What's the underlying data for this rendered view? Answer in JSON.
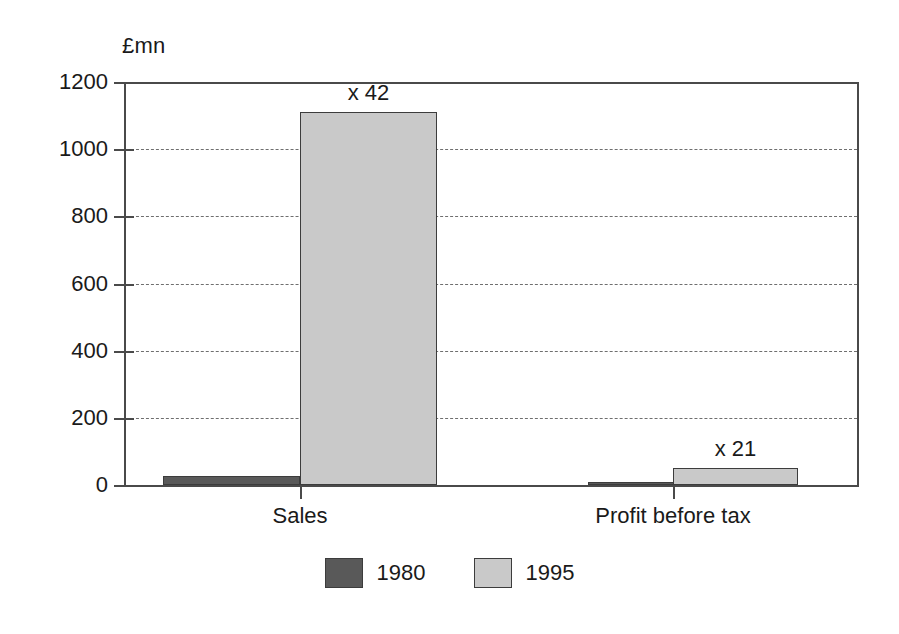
{
  "chart_data": {
    "type": "bar",
    "title": "",
    "subtitle": "",
    "unit_label": "£mn",
    "xlabel": "",
    "ylabel": "£mn",
    "categories": [
      "Sales",
      "Profit before tax"
    ],
    "series": [
      {
        "name": "1980",
        "color": "#595959",
        "values": [
          26,
          10
        ]
      },
      {
        "name": "1995",
        "color": "#c9c9c9",
        "values": [
          1110,
          52
        ]
      }
    ],
    "annotations": [
      {
        "text": "x 42",
        "category": "Sales",
        "series": "1995"
      },
      {
        "text": "x 21",
        "category": "Profit before tax",
        "series": "1995"
      }
    ],
    "ylim": [
      0,
      1200
    ],
    "yticks": [
      0,
      200,
      400,
      600,
      800,
      1000,
      1200
    ],
    "ytick_labels": [
      "0",
      "200",
      "400",
      "600",
      "800",
      "1000",
      "1200"
    ],
    "grid": true,
    "grid_style": "dashed",
    "legend_position": "bottom",
    "legend_entries": [
      "1980",
      "1995"
    ]
  }
}
